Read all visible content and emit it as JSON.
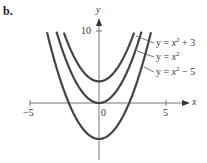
{
  "panel_label": "b.",
  "chart_data": {
    "type": "line",
    "title": "",
    "xlabel": "x",
    "ylabel": "y",
    "xlim": [
      -5,
      5
    ],
    "ylim": [
      -6,
      10
    ],
    "xticks": [
      "-5",
      "0",
      "5"
    ],
    "yticks": [
      "10"
    ],
    "grid": false,
    "series": [
      {
        "name": "y = x^2 + 3",
        "formula": "x^2+3",
        "vertex": [
          0,
          3
        ]
      },
      {
        "name": "y = x^2",
        "formula": "x^2",
        "vertex": [
          0,
          0
        ]
      },
      {
        "name": "y = x^2 − 5",
        "formula": "x^2-5",
        "vertex": [
          0,
          -5
        ]
      }
    ],
    "annotations": [
      "y = x² + 3",
      "y = x²",
      "y = x² − 5"
    ]
  },
  "labels": {
    "x_axis": "x",
    "y_axis": "y",
    "tick_neg5": "−5",
    "tick_0": "0",
    "tick_5": "5",
    "tick_10": "10"
  }
}
